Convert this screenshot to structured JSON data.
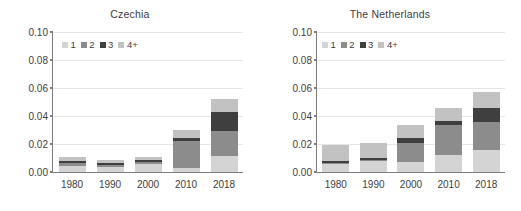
{
  "figure": {
    "background": "#ffffff"
  },
  "chart_data": [
    {
      "type": "bar",
      "title": "Czechia",
      "xlabel": "",
      "ylabel": "",
      "categories": [
        "1980",
        "1990",
        "2000",
        "2010",
        "2018"
      ],
      "ylim": [
        0.0,
        0.1
      ],
      "yticks": [
        "0.00",
        "0.02",
        "0.04",
        "0.06",
        "0.08",
        "0.10"
      ],
      "ytick_values": [
        0.0,
        0.02,
        0.04,
        0.06,
        0.08,
        0.1
      ],
      "grid": true,
      "stacked": true,
      "legend_position": "upper left",
      "series": [
        {
          "name": "1",
          "color": "#d4d4d4",
          "values": [
            0.0045,
            0.0038,
            0.0058,
            0.0032,
            0.0115
          ]
        },
        {
          "name": "2",
          "color": "#8c8c8c",
          "values": [
            0.002,
            0.0012,
            0.0015,
            0.0188,
            0.0175
          ]
        },
        {
          "name": "3",
          "color": "#3f3f3f",
          "values": [
            0.0016,
            0.0014,
            0.0013,
            0.0022,
            0.014
          ]
        },
        {
          "name": "4+",
          "color": "#c2c2c2",
          "values": [
            0.0029,
            0.0021,
            0.0024,
            0.0058,
            0.009
          ]
        }
      ],
      "totals": [
        0.011,
        0.0085,
        0.011,
        0.03,
        0.052
      ]
    },
    {
      "type": "bar",
      "title": "The Netherlands",
      "xlabel": "",
      "ylabel": "",
      "categories": [
        "1980",
        "1990",
        "2000",
        "2010",
        "2018"
      ],
      "ylim": [
        0.0,
        0.1
      ],
      "yticks": [
        "0.00",
        "0.02",
        "0.04",
        "0.06",
        "0.08",
        "0.10"
      ],
      "ytick_values": [
        0.0,
        0.02,
        0.04,
        0.06,
        0.08,
        0.1
      ],
      "grid": true,
      "stacked": true,
      "legend_position": "upper left",
      "series": [
        {
          "name": "1",
          "color": "#d4d4d4",
          "values": [
            0.0055,
            0.0078,
            0.0068,
            0.0123,
            0.0158
          ]
        },
        {
          "name": "2",
          "color": "#8c8c8c",
          "values": [
            0.0008,
            0.001,
            0.0138,
            0.021,
            0.02
          ]
        },
        {
          "name": "3",
          "color": "#3f3f3f",
          "values": [
            0.0017,
            0.0015,
            0.0035,
            0.0035,
            0.01
          ]
        },
        {
          "name": "4+",
          "color": "#c2c2c2",
          "values": [
            0.011,
            0.0102,
            0.0095,
            0.0092,
            0.0112
          ]
        }
      ],
      "totals": [
        0.019,
        0.0205,
        0.0336,
        0.046,
        0.057
      ]
    }
  ],
  "legend": {
    "entries": [
      {
        "label": "1",
        "color": "#d4d4d4"
      },
      {
        "label": "2",
        "color": "#8c8c8c"
      },
      {
        "label": "3",
        "color": "#3f3f3f"
      },
      {
        "label": "4+",
        "color": "#c2c2c2"
      }
    ]
  }
}
